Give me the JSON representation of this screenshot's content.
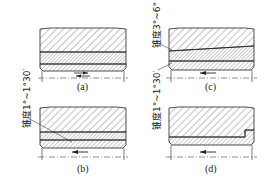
{
  "figure": {
    "panels": [
      {
        "id": "a",
        "caption": "(a)",
        "arrow": "bidirectional"
      },
      {
        "id": "b",
        "caption": "(b)",
        "arrow": "left"
      },
      {
        "id": "c",
        "caption": "(c)",
        "arrow": "left"
      },
      {
        "id": "d",
        "caption": "(d)",
        "arrow": "left"
      }
    ],
    "annotations": {
      "left_label": "锥度1°~1°30′",
      "c_upper_label": "锥度3°~6°",
      "c_lower_label": "锥度1°~1°30′"
    }
  }
}
